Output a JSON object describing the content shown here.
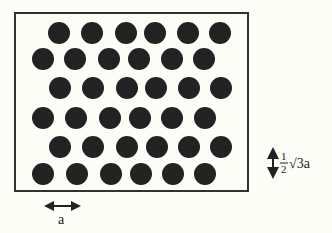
{
  "diagram": {
    "frame": {
      "x": 15,
      "y": 13,
      "width": 233,
      "height": 178
    },
    "circle_color": "#222222",
    "circle_radius": 11,
    "rows": [
      {
        "y": 33,
        "xs": [
          59,
          92,
          126,
          155,
          188,
          220
        ]
      },
      {
        "y": 59,
        "xs": [
          43,
          75,
          109,
          139,
          172,
          204
        ]
      },
      {
        "y": 88,
        "xs": [
          60,
          93,
          127,
          156,
          189,
          221
        ]
      },
      {
        "y": 118,
        "xs": [
          43,
          76,
          110,
          140,
          172,
          205
        ]
      },
      {
        "y": 147,
        "xs": [
          60,
          93,
          127,
          157,
          189,
          221
        ]
      },
      {
        "y": 174,
        "xs": [
          43,
          77,
          111,
          141,
          173,
          205
        ]
      }
    ],
    "horizontal_spacing": {
      "label": "a",
      "arrow": "double-headed horizontal"
    },
    "vertical_spacing": {
      "label_fraction_num": "1",
      "label_fraction_den": "2",
      "label_rest": "√3a",
      "arrow": "double-headed vertical"
    }
  }
}
